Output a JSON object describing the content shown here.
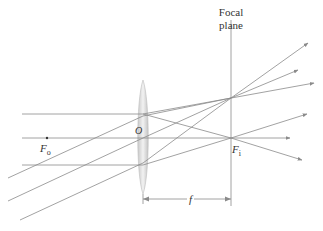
{
  "diagram": {
    "labels": {
      "focal_plane_line1": "Focal",
      "focal_plane_line2": "plane",
      "object_focus": "F",
      "object_focus_sub": "o",
      "image_focus": "F",
      "image_focus_sub": "i",
      "center": "O",
      "focal_length": "f"
    },
    "colors": {
      "ray": "#8a8a8a",
      "axis": "#8a8a8a",
      "lens_fill": "#d9d9d9",
      "lens_edge": "#bdbdbd",
      "text": "#333333"
    },
    "geometry": {
      "lens_x": 143,
      "axis_y": 138,
      "focal_plane_x": 231,
      "image_focus": [
        231,
        138
      ],
      "off_axis_focus": [
        231,
        98
      ]
    }
  }
}
